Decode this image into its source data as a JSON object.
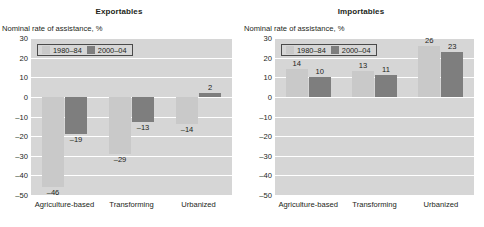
{
  "figure": {
    "top_caption": ""
  },
  "panels": [
    {
      "id": "exportables",
      "title": "Exportables",
      "axis_label": "Nominal rate of assistance, %",
      "legend": [
        {
          "label": "1980–84",
          "color": "#c9c9c9"
        },
        {
          "label": "2000–04",
          "color": "#7e7e7e"
        }
      ],
      "categories": [
        "Agriculture-based",
        "Transforming",
        "Urbanized"
      ],
      "yticks": [
        "30",
        "20",
        "10",
        "0",
        "–10",
        "–20",
        "–30",
        "–40",
        "–50"
      ],
      "labels": {
        "s0": [
          "–46",
          "–29",
          "–14"
        ],
        "s1": [
          "–19",
          "–13",
          "2"
        ]
      }
    },
    {
      "id": "importables",
      "title": "Importables",
      "axis_label": "Nominal rate of assistance, %",
      "legend": [
        {
          "label": "1980–84",
          "color": "#c9c9c9"
        },
        {
          "label": "2000–04",
          "color": "#7e7e7e"
        }
      ],
      "categories": [
        "Agriculture-based",
        "Transforming",
        "Urbanized"
      ],
      "yticks": [
        "30",
        "20",
        "10",
        "0",
        "–10",
        "–20",
        "–30",
        "–40",
        "–50"
      ],
      "labels": {
        "s0": [
          "14",
          "13",
          "26"
        ],
        "s1": [
          "10",
          "11",
          "23"
        ]
      }
    }
  ],
  "chart_data": [
    {
      "type": "bar",
      "title": "Exportables",
      "xlabel": "",
      "ylabel": "Nominal rate of assistance, %",
      "ylim": [
        -50,
        30
      ],
      "yticks": [
        30,
        20,
        10,
        0,
        -10,
        -20,
        -30,
        -40,
        -50
      ],
      "grid": true,
      "legend_position": "top-left-inside",
      "categories": [
        "Agriculture-based",
        "Transforming",
        "Urbanized"
      ],
      "series": [
        {
          "name": "1980–84",
          "color": "#c9c9c9",
          "values": [
            -46,
            -29,
            -14
          ]
        },
        {
          "name": "2000–04",
          "color": "#7e7e7e",
          "values": [
            -19,
            -13,
            2
          ]
        }
      ]
    },
    {
      "type": "bar",
      "title": "Importables",
      "xlabel": "",
      "ylabel": "Nominal rate of assistance, %",
      "ylim": [
        -50,
        30
      ],
      "yticks": [
        30,
        20,
        10,
        0,
        -10,
        -20,
        -30,
        -40,
        -50
      ],
      "grid": true,
      "legend_position": "top-left-inside",
      "categories": [
        "Agriculture-based",
        "Transforming",
        "Urbanized"
      ],
      "series": [
        {
          "name": "1980–84",
          "color": "#c9c9c9",
          "values": [
            14,
            13,
            26
          ]
        },
        {
          "name": "2000–04",
          "color": "#7e7e7e",
          "values": [
            10,
            11,
            23
          ]
        }
      ]
    }
  ]
}
